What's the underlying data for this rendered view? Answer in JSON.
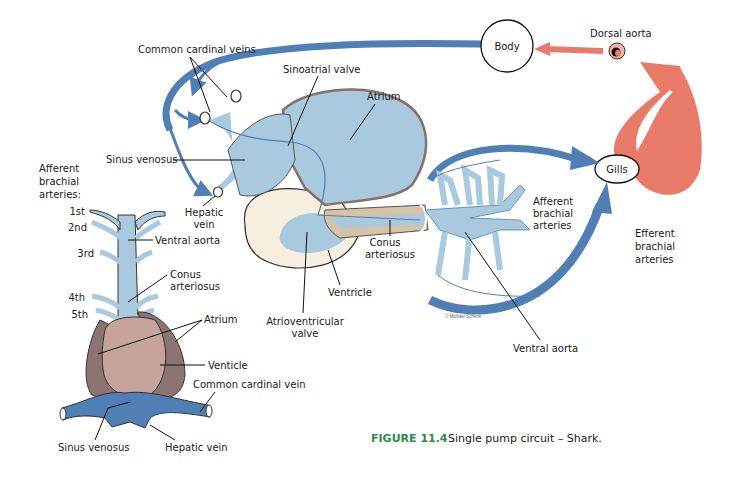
{
  "colors": {
    "venous_blue": "#4f7fb5",
    "heart_light_blue": "#a9c9df",
    "arterial_red": "#ea7a68",
    "atrium_wall": "#b89a96",
    "ventricle_cream": "#f6efdf",
    "conus_tan": "#d6c2a4",
    "dorsal_heart_brown": "#8e7470",
    "dorsal_ventricle_pink": "#c7a49b",
    "caption_green": "#2e8a4e"
  },
  "circuit": {
    "body_label": "Body",
    "dorsal_aorta_label": "Dorsal aorta",
    "gills_label": "Gills",
    "efferent_label": [
      "Efferent",
      "brachial",
      "arteries"
    ],
    "afferent_label": [
      "Afferent",
      "brachial",
      "arteries"
    ]
  },
  "lateral_heart": {
    "common_cardinal_veins": "Common cardinal veins",
    "sinoatrial_valve": "Sinoatrial valve",
    "atrium": "Atrium",
    "sinus_venosus": "Sinus venosus",
    "hepatic_vein": [
      "Hepatic",
      "vein"
    ],
    "conus_arteriosus": [
      "Conus",
      "arteriosus"
    ],
    "ventricle": "Ventricle",
    "atrioventricular_valve": [
      "Atrioventricular",
      "valve"
    ],
    "ventral_aorta": "Ventral aorta",
    "credit": "© Michael Schenk"
  },
  "ventral_heart": {
    "afferent_heading": [
      "Afferent",
      "brachial",
      "arteries:"
    ],
    "arch_labels": [
      "1st",
      "2nd",
      "3rd",
      "4th",
      "5th"
    ],
    "ventral_aorta": "Ventral aorta",
    "conus_arteriosus": [
      "Conus",
      "arteriosus"
    ],
    "atrium": "Atrium",
    "ventricle": "Venticle",
    "common_cardinal_vein": "Common cardinal vein",
    "sinus_venosus": "Sinus venosus",
    "hepatic_vein": "Hepatic vein"
  },
  "caption": {
    "number": "FIGURE 11.4",
    "text": "Single pump circuit – Shark."
  }
}
